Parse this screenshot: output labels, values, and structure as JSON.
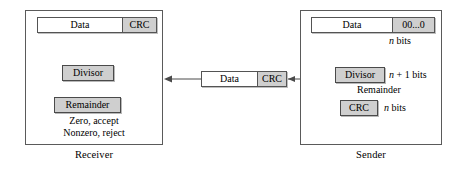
{
  "diagram": {
    "colors": {
      "panel_border": "#5a5a5a",
      "box_border": "#545454",
      "box_shaded_fill": "#cfcfcf",
      "funnel_gray": "#808080",
      "arrow_gray": "#808080",
      "line_dark": "#4a4a4a",
      "background": "#ffffff"
    }
  },
  "receiver": {
    "caption": "Receiver",
    "frame": {
      "data_label": "Data",
      "tail_label": "CRC"
    },
    "divisor_label": "Divisor",
    "remainder_label": "Remainder",
    "accept_text": "Zero, accept",
    "reject_text": "Nonzero, reject"
  },
  "sender": {
    "caption": "Sender",
    "frame": {
      "data_label": "Data",
      "tail_label": "00...0"
    },
    "nbits_top": "n bits",
    "divisor_label": "Divisor",
    "divisor_bits": "n + 1 bits",
    "remainder_label": "Remainder",
    "crc_label": "CRC",
    "crc_bits": "n bits"
  },
  "transmission": {
    "data_label": "Data",
    "crc_label": "CRC"
  }
}
